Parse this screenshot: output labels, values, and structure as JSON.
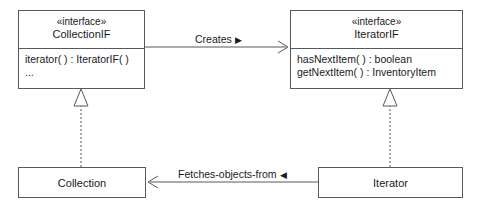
{
  "diagram": {
    "line_color": "#555a5e",
    "text_color": "#1a1a1a",
    "background": "#ffffff"
  },
  "classes": {
    "collection_if": {
      "stereotype": "«interface»",
      "name": "CollectionIF",
      "members": [
        "iterator( ) : IteratorIF( )",
        "..."
      ]
    },
    "iterator_if": {
      "stereotype": "«interface»",
      "name": "IteratorIF",
      "members": [
        "hasNextItem( ) : boolean",
        "getNextItem( ) : InventoryItem"
      ]
    },
    "collection": {
      "name": "Collection"
    },
    "iterator": {
      "name": "Iterator"
    }
  },
  "relationships": {
    "creates": {
      "label": "Creates",
      "direction_marker": "▶",
      "kind": "association-directed"
    },
    "fetches": {
      "label": "Fetches-objects-from",
      "direction_marker": "◀",
      "kind": "association-directed"
    },
    "realization_collection": {
      "kind": "realization",
      "arrowhead": "hollow-triangle"
    },
    "realization_iterator": {
      "kind": "realization",
      "arrowhead": "hollow-triangle"
    }
  }
}
